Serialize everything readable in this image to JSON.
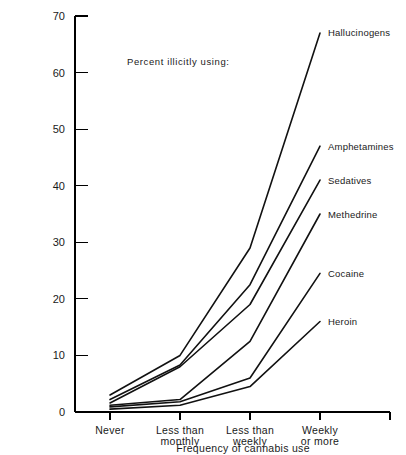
{
  "chart_data": {
    "type": "line",
    "title": "",
    "annotation": "Percent illicitly using:",
    "xlabel": "Frequency of cannabis use",
    "ylabel": "",
    "categories": [
      "Never",
      "Less than monthly",
      "Less than weekly",
      "Weekly or more"
    ],
    "category_lines": [
      [
        "Never"
      ],
      [
        "Less than",
        "monthly"
      ],
      [
        "Less than",
        "weekly"
      ],
      [
        "Weekly",
        "or more"
      ]
    ],
    "ylim": [
      0,
      70
    ],
    "yticks": [
      0,
      10,
      20,
      30,
      40,
      50,
      60,
      70
    ],
    "ytick_labels": [
      "0",
      "10",
      "20",
      "30",
      "40",
      "50",
      "60",
      "70"
    ],
    "grid": false,
    "legend_position": "right-inline-labels",
    "series": [
      {
        "name": "Hallucinogens",
        "values": [
          3.0,
          10.0,
          29.0,
          67.0
        ]
      },
      {
        "name": "Amphetamines",
        "values": [
          2.2,
          8.3,
          22.5,
          47.0
        ]
      },
      {
        "name": "Sedatives",
        "values": [
          1.6,
          8.0,
          19.0,
          41.0
        ]
      },
      {
        "name": "Methedrine",
        "values": [
          1.2,
          2.2,
          12.5,
          35.0
        ]
      },
      {
        "name": "Cocaine",
        "values": [
          0.9,
          1.8,
          6.0,
          24.5
        ]
      },
      {
        "name": "Heroin",
        "values": [
          0.5,
          1.2,
          4.5,
          16.0
        ]
      }
    ]
  },
  "colors": {
    "line": "#111111",
    "axis": "#000000",
    "background": "#ffffff",
    "text": "#1a1a1a"
  }
}
